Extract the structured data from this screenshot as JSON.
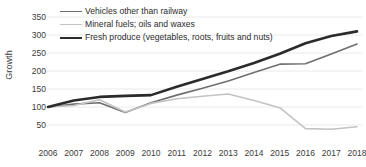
{
  "chart_data": {
    "type": "line",
    "title": "",
    "xlabel": "",
    "ylabel": "Growth",
    "x": [
      2006,
      2007,
      2008,
      2009,
      2010,
      2011,
      2012,
      2013,
      2014,
      2015,
      2016,
      2017,
      2018
    ],
    "xtick_labels": [
      "2006",
      "2007",
      "2008",
      "2009",
      "2010",
      "2011",
      "2012",
      "2013",
      "2014",
      "2015",
      "2016",
      "2017",
      "2018"
    ],
    "ytick_labels": [
      "50",
      "100",
      "150",
      "200",
      "250",
      "300",
      "350"
    ],
    "yticks": [
      50,
      100,
      150,
      200,
      250,
      300,
      350
    ],
    "ylim": [
      25,
      365
    ],
    "xlim": [
      2006,
      2018
    ],
    "grid": true,
    "grid_axis": "y",
    "legend_position": "top-left",
    "series": [
      {
        "name": "Vehicles other than railway",
        "color": "#6f6f6f",
        "width": 1.6,
        "values": [
          100,
          108,
          112,
          85,
          112,
          133,
          152,
          172,
          196,
          219,
          220,
          247,
          275
        ]
      },
      {
        "name": "Mineral fuels; oils and waxes",
        "color": "#c3c3c3",
        "width": 1.6,
        "values": [
          100,
          104,
          120,
          86,
          110,
          123,
          130,
          136,
          118,
          98,
          40,
          38,
          45
        ]
      },
      {
        "name": "Fresh produce (vegetables, roots, fruits and nuts)",
        "color": "#2b2b2b",
        "width": 2.6,
        "values": [
          100,
          118,
          128,
          131,
          133,
          156,
          178,
          199,
          222,
          248,
          277,
          297,
          310
        ]
      }
    ]
  },
  "axis": {
    "y_title": "Growth"
  }
}
